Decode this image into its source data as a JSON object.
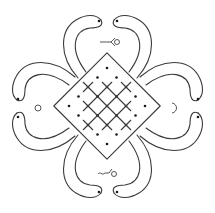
{
  "figure": {
    "title": "Kolam pattern with four heart-shaped petals around a dotted lattice",
    "colors": {
      "background": "#ffffff",
      "stroke": "#3a3a3a",
      "dot": "#1a1a1a"
    }
  },
  "lattice": {
    "center": [
      107,
      106
    ],
    "step": 9.5,
    "shape": "diamond",
    "description": "Diagonal lattice of dots enclosed by interwoven loops, split by a central vertical channel"
  },
  "petals": [
    {
      "position": "top",
      "ornament": "arrow-with-loop-right"
    },
    {
      "position": "right",
      "ornament": "crescent"
    },
    {
      "position": "bottom",
      "ornament": "squiggle-with-loop"
    },
    {
      "position": "left",
      "ornament": "small-circle"
    }
  ],
  "symbols": {
    "top": "-<○",
    "bottom": "~⌐○",
    "left": "○",
    "right": "☽"
  }
}
